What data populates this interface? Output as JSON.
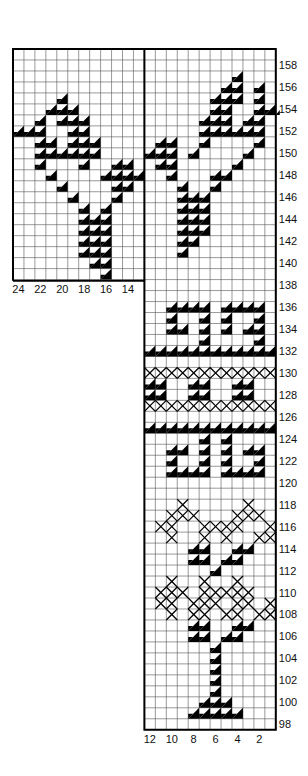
{
  "chart_data": {
    "type": "heatmap",
    "title": "",
    "row_labels": [
      "158",
      "156",
      "154",
      "152",
      "150",
      "148",
      "146",
      "144",
      "142",
      "140",
      "138",
      "136",
      "134",
      "132",
      "130",
      "128",
      "126",
      "124",
      "122",
      "120",
      "118",
      "116",
      "114",
      "112",
      "110",
      "108",
      "106",
      "104",
      "102",
      "100",
      "98"
    ],
    "left_col_labels": [
      "24",
      "22",
      "20",
      "18",
      "16",
      "14"
    ],
    "bottom_col_labels": [
      "12",
      "10",
      "8",
      "6",
      "4",
      "2"
    ],
    "row_range": [
      159,
      97
    ],
    "left_panel": {
      "columns": [
        24,
        13
      ],
      "rows": [
        159,
        140
      ],
      "cells": {
        "155": {
          "20": "T"
        },
        "154": {
          "21": "T",
          "20": "T",
          "19": "T"
        },
        "153": {
          "22": "T",
          "20": "T",
          "19": "T",
          "18": "T"
        },
        "152": {
          "24": "T",
          "23": "T",
          "22": "T",
          "19": "T",
          "18": "T"
        },
        "151": {
          "22": "T",
          "21": "T",
          "19": "T",
          "18": "T",
          "17": "T"
        },
        "150": {
          "22": "T",
          "21": "T",
          "20": "T",
          "19": "T",
          "18": "T",
          "17": "T"
        },
        "149": {
          "22": "T",
          "18": "T",
          "15": "T",
          "14": "T"
        },
        "148": {
          "21": "T",
          "16": "T",
          "15": "T",
          "14": "T",
          "13": "T"
        },
        "147": {
          "20": "T",
          "15": "T",
          "14": "T"
        },
        "146": {
          "19": "T",
          "15": "T"
        },
        "145": {
          "18": "T",
          "16": "T"
        },
        "144": {
          "18": "T",
          "17": "T",
          "16": "T"
        },
        "143": {
          "18": "T",
          "17": "T",
          "16": "T"
        },
        "142": {
          "18": "T",
          "17": "T",
          "16": "T"
        },
        "141": {
          "18": "T",
          "17": "T",
          "16": "T"
        },
        "140": {
          "17": "T",
          "16": "T"
        },
        "139": {
          "16": "T"
        }
      }
    },
    "right_panel": {
      "columns": [
        12,
        1
      ],
      "rows": [
        159,
        97
      ],
      "cells": {
        "157": {
          "4": "T"
        },
        "156": {
          "5": "T",
          "4": "T",
          "2": "T"
        },
        "155": {
          "6": "T",
          "5": "T",
          "4": "T",
          "2": "T"
        },
        "154": {
          "6": "T",
          "5": "T",
          "2": "T",
          "1": "T",
          "0": "T"
        },
        "153": {
          "7": "T",
          "6": "T",
          "5": "T",
          "3": "T",
          "2": "T"
        },
        "152": {
          "7": "T",
          "6": "T",
          "5": "T",
          "4": "T",
          "3": "T",
          "2": "T"
        },
        "151": {
          "11": "T",
          "10": "T",
          "7": "T",
          "2": "T"
        },
        "150": {
          "12": "T",
          "11": "T",
          "10": "T",
          "8": "T",
          "3": "T"
        },
        "149": {
          "11": "T",
          "10": "T",
          "4": "T"
        },
        "148": {
          "10": "T",
          "6": "T",
          "5": "T"
        },
        "147": {
          "9": "T",
          "6": "T"
        },
        "146": {
          "9": "T",
          "8": "T",
          "7": "T"
        },
        "145": {
          "9": "T",
          "8": "T",
          "7": "T"
        },
        "144": {
          "9": "T",
          "8": "T",
          "7": "T"
        },
        "143": {
          "9": "T",
          "8": "T",
          "7": "T"
        },
        "142": {
          "9": "T",
          "8": "T"
        },
        "141": {
          "9": "T"
        },
        "136": {
          "10": "T",
          "9": "T",
          "8": "T",
          "7": "T",
          "5": "T",
          "4": "T",
          "3": "T",
          "2": "T"
        },
        "135": {
          "10": "T",
          "7": "T",
          "5": "T",
          "2": "T"
        },
        "134": {
          "10": "T",
          "9": "T",
          "7": "T",
          "5": "T",
          "3": "T",
          "2": "T"
        },
        "133": {
          "7": "T",
          "2": "T"
        },
        "132": {
          "12": "T",
          "11": "T",
          "10": "T",
          "9": "T",
          "8": "T",
          "7": "T",
          "6": "T",
          "5": "T",
          "4": "T",
          "3": "T",
          "2": "T",
          "1": "T"
        },
        "130": {
          "12": "X",
          "11": "X",
          "10": "X",
          "9": "X",
          "8": "X",
          "7": "X",
          "6": "X",
          "5": "X",
          "4": "X",
          "3": "X",
          "2": "X",
          "1": "X"
        },
        "129": {
          "12": "T",
          "11": "T",
          "8": "T",
          "7": "T",
          "4": "T",
          "3": "T"
        },
        "128": {
          "12": "T",
          "11": "T",
          "8": "T",
          "7": "T",
          "4": "T",
          "3": "T"
        },
        "127": {
          "12": "X",
          "11": "X",
          "10": "X",
          "9": "X",
          "8": "X",
          "7": "X",
          "6": "X",
          "5": "X",
          "4": "X",
          "3": "X",
          "2": "X",
          "1": "X"
        },
        "125": {
          "12": "T",
          "11": "T",
          "10": "T",
          "9": "T",
          "8": "T",
          "7": "T",
          "6": "T",
          "5": "T",
          "4": "T",
          "3": "T",
          "2": "T",
          "1": "T"
        },
        "124": {
          "7": "T",
          "5": "T"
        },
        "123": {
          "10": "T",
          "9": "T",
          "7": "T",
          "5": "T",
          "3": "T",
          "2": "T"
        },
        "122": {
          "10": "T",
          "7": "T",
          "5": "T",
          "2": "T"
        },
        "121": {
          "10": "T",
          "9": "T",
          "8": "T",
          "7": "T",
          "5": "T",
          "4": "T",
          "3": "T",
          "2": "T"
        },
        "118": {
          "9": "X",
          "3": "X"
        },
        "117": {
          "10": "X",
          "9": "X",
          "8": "X",
          "4": "X",
          "3": "X",
          "2": "X"
        },
        "116": {
          "11": "X",
          "10": "X",
          "7": "X",
          "6": "X",
          "5": "X",
          "4": "X",
          "1": "X"
        },
        "115": {
          "10": "X",
          "7": "X",
          "5": "X",
          "2": "X",
          "1": "X"
        },
        "114": {
          "8": "T",
          "7": "T",
          "4": "T",
          "3": "T"
        },
        "113": {
          "8": "T",
          "7": "T",
          "5": "T",
          "4": "T"
        },
        "112": {
          "6": "T"
        },
        "111": {
          "10": "X",
          "7": "X",
          "4": "X"
        },
        "110": {
          "11": "X",
          "10": "X",
          "9": "X",
          "7": "X",
          "6": "X",
          "5": "X",
          "4": "X",
          "3": "X"
        },
        "109": {
          "11": "X",
          "10": "X",
          "8": "X",
          "7": "X",
          "6": "X",
          "4": "X",
          "3": "X",
          "1": "X"
        },
        "108": {
          "10": "X",
          "8": "X",
          "7": "X",
          "5": "X",
          "4": "X",
          "2": "X",
          "1": "X"
        },
        "107": {
          "8": "T",
          "7": "T",
          "4": "T",
          "3": "T"
        },
        "106": {
          "8": "T",
          "7": "T",
          "5": "T",
          "4": "T"
        },
        "105": {
          "6": "T"
        },
        "104": {
          "6": "T"
        },
        "103": {
          "6": "T"
        },
        "102": {
          "6": "T"
        },
        "101": {
          "6": "T"
        },
        "100": {
          "7": "T",
          "6": "T",
          "5": "T"
        },
        "99": {
          "8": "T",
          "7": "T",
          "6": "T",
          "5": "T",
          "4": "T"
        }
      }
    },
    "legend": {
      "T": "half-filled triangle stitch",
      "X": "cross stitch"
    },
    "grid": true
  }
}
